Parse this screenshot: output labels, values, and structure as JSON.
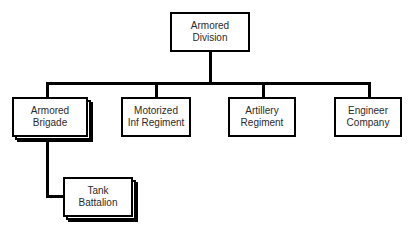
{
  "diagram": {
    "background_color": "#ffffff",
    "line_color": "#000000",
    "box_fill": "#ffffff",
    "text_color": "#2b2b2b",
    "nodes": {
      "root": {
        "line1": "Armored",
        "line2": "Division",
        "stacked": "false"
      },
      "child1": {
        "line1": "Armored",
        "line2": "Brigade",
        "stacked": "true"
      },
      "child2": {
        "line1": "Motorized",
        "line2": "Inf Regiment",
        "stacked": "false"
      },
      "child3": {
        "line1": "Artillery",
        "line2": "Regiment",
        "stacked": "false"
      },
      "child4": {
        "line1": "Engineer",
        "line2": "Company",
        "stacked": "false"
      },
      "grandchild1": {
        "line1": "Tank",
        "line2": "Battalion",
        "stacked": "true"
      }
    }
  }
}
